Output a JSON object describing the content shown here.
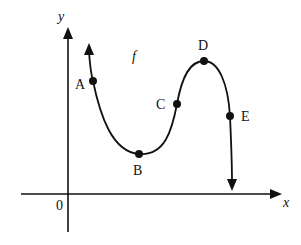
{
  "figure": {
    "function_label": "f",
    "axes": {
      "x_label": "x",
      "y_label": "y",
      "origin_label": "0"
    },
    "points": [
      {
        "label": "A",
        "x": 93,
        "y": 81
      },
      {
        "label": "B",
        "x": 139,
        "y": 154
      },
      {
        "label": "C",
        "x": 177,
        "y": 104
      },
      {
        "label": "D",
        "x": 204,
        "y": 61
      },
      {
        "label": "E",
        "x": 230,
        "y": 116
      }
    ],
    "colors": {
      "ink": "#111111",
      "background": "#ffffff"
    }
  }
}
